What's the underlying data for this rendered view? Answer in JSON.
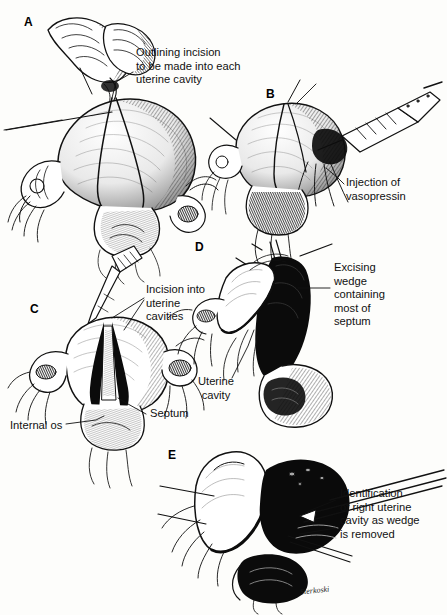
{
  "figure": {
    "background_color": "#fdfdfb",
    "ink_color": "#111111",
    "signature": "Sterkoski"
  },
  "panels": [
    {
      "letter": "A",
      "callouts": [
        {
          "id": "a1",
          "text": "Outlining incision\nto be made into each\nuterine cavity"
        }
      ]
    },
    {
      "letter": "B",
      "callouts": [
        {
          "id": "b1",
          "text": "Injection of\nvasopressin"
        }
      ]
    },
    {
      "letter": "C",
      "callouts": [
        {
          "id": "c1",
          "text": "Incision into\nuterine\ncavities"
        },
        {
          "id": "c2",
          "text": "Septum"
        },
        {
          "id": "c3",
          "text": "Internal os"
        }
      ]
    },
    {
      "letter": "D",
      "callouts": [
        {
          "id": "d1",
          "text": "Excising\nwedge\ncontaining\nmost of\nseptum"
        },
        {
          "id": "d2",
          "text": "Uterine\ncavity"
        }
      ]
    },
    {
      "letter": "E",
      "callouts": [
        {
          "id": "e1",
          "text": "Identification\nof right uterine\ncavity as wedge\nis removed"
        }
      ]
    }
  ]
}
